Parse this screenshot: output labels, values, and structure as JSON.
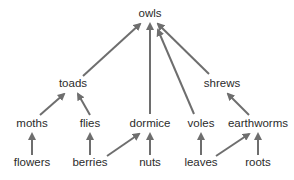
{
  "diagram": {
    "type": "food-web",
    "arrow_color": "#6e6e6e",
    "text_color": "#2b2b2b",
    "nodes": {
      "owls": {
        "label": "owls",
        "x": 150,
        "y": 14
      },
      "toads": {
        "label": "toads",
        "x": 73,
        "y": 84
      },
      "shrews": {
        "label": "shrews",
        "x": 222,
        "y": 84
      },
      "moths": {
        "label": "moths",
        "x": 32,
        "y": 124
      },
      "flies": {
        "label": "flies",
        "x": 90,
        "y": 124
      },
      "dormice": {
        "label": "dormice",
        "x": 150,
        "y": 124
      },
      "voles": {
        "label": "voles",
        "x": 201,
        "y": 124
      },
      "earthworms": {
        "label": "earthworms",
        "x": 258,
        "y": 124
      },
      "flowers": {
        "label": "flowers",
        "x": 32,
        "y": 163
      },
      "berries": {
        "label": "berries",
        "x": 90,
        "y": 163
      },
      "nuts": {
        "label": "nuts",
        "x": 150,
        "y": 163
      },
      "leaves": {
        "label": "leaves",
        "x": 201,
        "y": 163
      },
      "roots": {
        "label": "roots",
        "x": 258,
        "y": 163
      }
    },
    "edges": [
      {
        "from": "toads",
        "to": "owls",
        "x1": 83,
        "y1": 76,
        "x2": 140,
        "y2": 24
      },
      {
        "from": "dormice",
        "to": "owls",
        "x1": 150,
        "y1": 114,
        "x2": 150,
        "y2": 24
      },
      {
        "from": "voles",
        "to": "owls",
        "x1": 194,
        "y1": 114,
        "x2": 158,
        "y2": 30
      },
      {
        "from": "shrews",
        "to": "owls",
        "x1": 209,
        "y1": 74,
        "x2": 158,
        "y2": 24
      },
      {
        "from": "moths",
        "to": "toads",
        "x1": 40,
        "y1": 115,
        "x2": 64,
        "y2": 94
      },
      {
        "from": "flies",
        "to": "toads",
        "x1": 90,
        "y1": 115,
        "x2": 78,
        "y2": 94
      },
      {
        "from": "earthworms",
        "to": "shrews",
        "x1": 249,
        "y1": 115,
        "x2": 228,
        "y2": 94
      },
      {
        "from": "flowers",
        "to": "moths",
        "x1": 32,
        "y1": 155,
        "x2": 32,
        "y2": 134
      },
      {
        "from": "berries",
        "to": "flies",
        "x1": 90,
        "y1": 155,
        "x2": 90,
        "y2": 134
      },
      {
        "from": "berries",
        "to": "dormice",
        "x1": 107,
        "y1": 156,
        "x2": 139,
        "y2": 134
      },
      {
        "from": "nuts",
        "to": "dormice",
        "x1": 150,
        "y1": 155,
        "x2": 150,
        "y2": 134
      },
      {
        "from": "leaves",
        "to": "voles",
        "x1": 201,
        "y1": 155,
        "x2": 201,
        "y2": 134
      },
      {
        "from": "leaves",
        "to": "earthworms",
        "x1": 216,
        "y1": 156,
        "x2": 249,
        "y2": 134
      },
      {
        "from": "roots",
        "to": "earthworms",
        "x1": 258,
        "y1": 155,
        "x2": 258,
        "y2": 134
      }
    ]
  }
}
